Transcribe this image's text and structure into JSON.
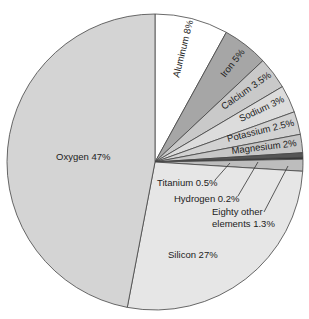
{
  "chart_data": {
    "type": "pie",
    "title": "",
    "start_angle_deg": 0,
    "direction": "clockwise",
    "slices": [
      {
        "name": "Aluminum",
        "value": 8,
        "label": "Aluminum 8%",
        "color": "#ffffff"
      },
      {
        "name": "Iron",
        "value": 5,
        "label": "Iron 5%",
        "color": "#a6a6a6"
      },
      {
        "name": "Calcium",
        "value": 3.5,
        "label": "Calcium 3.5%",
        "color": "#c9c9c9"
      },
      {
        "name": "Sodium",
        "value": 3,
        "label": "Sodium 3%",
        "color": "#dcdcdc"
      },
      {
        "name": "Potassium",
        "value": 2.5,
        "label": "Potassium 2.5%",
        "color": "#d2d2d2"
      },
      {
        "name": "Magnesium",
        "value": 2,
        "label": "Magnesium 2%",
        "color": "#c6c6c6"
      },
      {
        "name": "Titanium",
        "value": 0.5,
        "label": "Titanium 0.5%",
        "color": "#555555"
      },
      {
        "name": "Hydrogen",
        "value": 0.2,
        "label": "Hydrogen 0.2%",
        "color": "#333333"
      },
      {
        "name": "Eighty other elements",
        "value": 1.3,
        "label": "Eighty other elements 1.3%",
        "color": "#bdbdbd"
      },
      {
        "name": "Silicon",
        "value": 27,
        "label": "Silicon 27%",
        "color": "#e6e6e6"
      },
      {
        "name": "Oxygen",
        "value": 47,
        "label": "Oxygen 47%",
        "color": "#d4d4d4"
      }
    ],
    "legend": "none (inline labels)"
  },
  "labels": {
    "aluminum": "Aluminum 8%",
    "iron": "Iron 5%",
    "calcium": "Calcium 3.5%",
    "sodium": "Sodium 3%",
    "potassium": "Potassium 2.5%",
    "magnesium": "Magnesium 2%",
    "titanium": "Titanium 0.5%",
    "hydrogen": "Hydrogen 0.2%",
    "other_line1": "Eighty other",
    "other_line2": "elements 1.3%",
    "silicon": "Silicon 27%",
    "oxygen": "Oxygen 47%"
  }
}
